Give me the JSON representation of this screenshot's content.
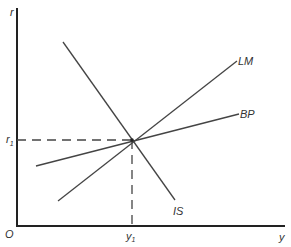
{
  "diagram": {
    "type": "IS-LM-BP",
    "axes": {
      "y_label": "r",
      "x_label": "y",
      "origin_label": "O"
    },
    "equilibrium": {
      "r_label": "r",
      "r_subscript": "1",
      "y_label": "y",
      "y_subscript": "1"
    },
    "curves": [
      {
        "name": "IS",
        "label": "IS",
        "slope": "negative"
      },
      {
        "name": "LM",
        "label": "LM",
        "slope": "positive-steep"
      },
      {
        "name": "BP",
        "label": "BP",
        "slope": "positive-flat"
      }
    ],
    "colors": {
      "axis": "#222222",
      "curve": "#444444",
      "dashed": "#444444",
      "text": "#333333"
    }
  }
}
